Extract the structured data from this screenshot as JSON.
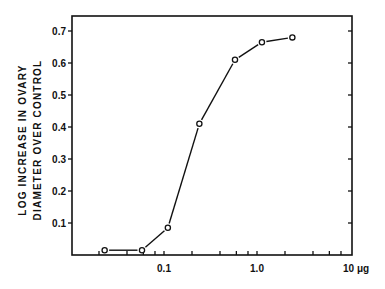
{
  "chart_data": {
    "type": "line",
    "title": "",
    "xlabel": "μg",
    "ylabel": [
      "LOG INCREASE IN OVARY",
      "DIAMETER OVER CONTROL"
    ],
    "xscale": "log",
    "xlim": [
      0.01,
      10
    ],
    "ylim": [
      0,
      0.75
    ],
    "x_ticks": [
      {
        "value": 0.1,
        "label": "0.1"
      },
      {
        "value": 1.0,
        "label": "1.0"
      },
      {
        "value": 10,
        "label": "10 μg"
      }
    ],
    "y_ticks": [
      {
        "value": 0.1,
        "label": "0.1"
      },
      {
        "value": 0.2,
        "label": "0.2"
      },
      {
        "value": 0.3,
        "label": "0.3"
      },
      {
        "value": 0.4,
        "label": "0.4"
      },
      {
        "value": 0.5,
        "label": "0.5"
      },
      {
        "value": 0.6,
        "label": "0.6"
      },
      {
        "value": 0.7,
        "label": "0.7"
      }
    ],
    "grid": false,
    "legend": null,
    "series": [
      {
        "name": "ovary diameter response",
        "marker": "open-circle",
        "x": [
          0.023,
          0.058,
          0.11,
          0.24,
          0.58,
          1.13,
          2.4
        ],
        "y": [
          0.015,
          0.015,
          0.085,
          0.41,
          0.61,
          0.665,
          0.68
        ]
      }
    ]
  },
  "labels": {
    "ylabel_line1": "LOG INCREASE IN OVARY",
    "ylabel_line2": "DIAMETER OVER CONTROL"
  }
}
